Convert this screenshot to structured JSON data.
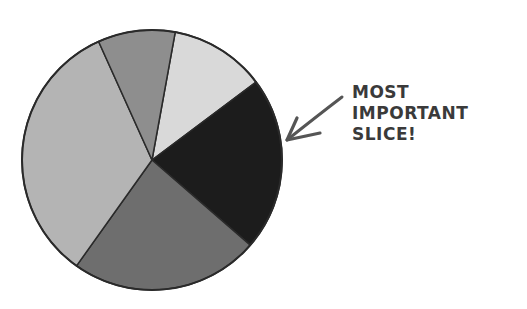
{
  "chart_data": {
    "type": "pie",
    "title": "",
    "center": [
      152,
      160
    ],
    "radius": 130,
    "start_angle_deg": -79.7,
    "slices": [
      {
        "name": "light",
        "percent": 11.9,
        "color": "#d9d9d9"
      },
      {
        "name": "black",
        "percent": 21.6,
        "color": "#1c1c1c",
        "highlighted": true
      },
      {
        "name": "dark-gray",
        "percent": 23.5,
        "color": "#6e6e6e"
      },
      {
        "name": "medium-light-gray",
        "percent": 33.4,
        "color": "#b4b4b4"
      },
      {
        "name": "medium-gray",
        "percent": 9.6,
        "color": "#8e8e8e"
      }
    ],
    "values": [
      11.9,
      21.6,
      23.5,
      33.4,
      9.6
    ],
    "annotations": [
      {
        "text": "MOST IMPORTANT SLICE!",
        "points_to": "black",
        "arrow": true
      }
    ],
    "legend": null
  },
  "annotation": {
    "lines": [
      "MOST",
      "IMPORTANT",
      "SLICE!"
    ],
    "color": "#3a3a3a"
  },
  "arrow": {
    "from": [
      342,
      97
    ],
    "to": [
      287,
      140
    ],
    "color": "#555555"
  }
}
